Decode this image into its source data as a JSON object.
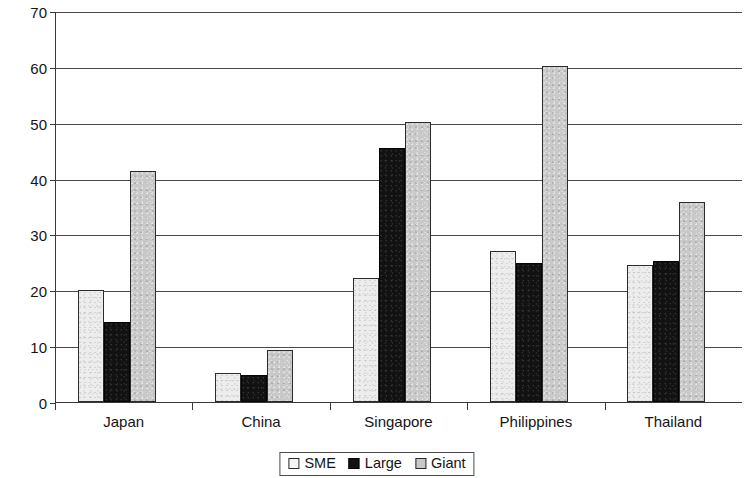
{
  "chart_data": {
    "type": "bar",
    "title": "",
    "subtitle": "",
    "xlabel": "",
    "ylabel": "",
    "categories": [
      "Japan",
      "China",
      "Singapore",
      "Philippines",
      "Thailand"
    ],
    "series": [
      {
        "name": "SME",
        "color": "#ececec",
        "values": [
          20.0,
          5.2,
          22.2,
          27.0,
          24.5
        ]
      },
      {
        "name": "Large",
        "color": "#121212",
        "values": [
          14.3,
          4.8,
          45.5,
          24.8,
          25.3
        ]
      },
      {
        "name": "Giant",
        "color": "#c8c8c8",
        "values": [
          41.3,
          9.4,
          50.2,
          60.2,
          35.8
        ]
      }
    ],
    "ylim": [
      0,
      70
    ],
    "ytick_values": [
      0,
      10,
      20,
      30,
      40,
      50,
      60,
      70
    ],
    "ytick_labels": [
      "0",
      "10",
      "20",
      "30",
      "40",
      "50",
      "60",
      "70"
    ],
    "grid": true,
    "grid_axis": "y",
    "legend_position": "bottom",
    "legend_entries": [
      "SME",
      "Large",
      "Giant"
    ]
  },
  "axes": {
    "y_labels": [
      "70",
      "60",
      "50",
      "40",
      "30",
      "20",
      "10",
      "0"
    ],
    "x_labels": [
      "Japan",
      "China",
      "Singapore",
      "Philippines",
      "Thailand"
    ]
  },
  "legend": {
    "items": [
      {
        "label": "SME"
      },
      {
        "label": "Large"
      },
      {
        "label": "Giant"
      }
    ]
  }
}
